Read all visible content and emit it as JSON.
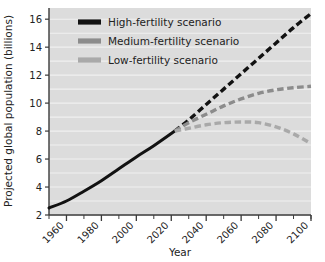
{
  "chart_data": {
    "type": "line",
    "title": "",
    "subtitle": "",
    "xlabel": "Year",
    "ylabel": "Projected global population (billions)",
    "xlim": [
      1950,
      2100
    ],
    "ylim": [
      2,
      16.8
    ],
    "grid": true,
    "grid_orientation": "horizontal",
    "legend_position": "top-center",
    "xticks": [
      1960,
      1980,
      2000,
      2020,
      2040,
      2060,
      2080,
      2100
    ],
    "xtick_labels": [
      "1960",
      "1980",
      "2000",
      "2020",
      "2040",
      "2060",
      "2080",
      "2100"
    ],
    "xminor_ticks": [
      1950,
      1970,
      1990,
      2010,
      2030,
      2050,
      2070,
      2090,
      2100
    ],
    "yticks": [
      2,
      4,
      6,
      8,
      10,
      12,
      14,
      16
    ],
    "ytick_labels": [
      "2",
      "4",
      "6",
      "8",
      "10",
      "12",
      "14",
      "16"
    ],
    "branch_point": {
      "x": 2022,
      "y": 8.0
    },
    "series": [
      {
        "name": "Historical",
        "style": "solid",
        "color": "#121212",
        "x": [
          1950,
          1960,
          1970,
          1980,
          1990,
          2000,
          2010,
          2022
        ],
        "values": [
          2.5,
          3.0,
          3.7,
          4.45,
          5.3,
          6.15,
          6.95,
          8.0
        ]
      },
      {
        "name": "High-fertility scenario",
        "style": "dashed",
        "color": "#121212",
        "x": [
          2022,
          2030,
          2040,
          2050,
          2060,
          2070,
          2080,
          2090,
          2100
        ],
        "values": [
          8.0,
          8.8,
          9.9,
          11.0,
          12.1,
          13.2,
          14.3,
          15.4,
          16.4
        ]
      },
      {
        "name": "Medium-fertility scenario",
        "style": "dashed",
        "color": "#8c8c8c",
        "x": [
          2022,
          2030,
          2040,
          2050,
          2060,
          2070,
          2080,
          2090,
          2100
        ],
        "values": [
          8.0,
          8.6,
          9.2,
          9.8,
          10.3,
          10.7,
          10.95,
          11.1,
          11.2
        ]
      },
      {
        "name": "Low-fertility scenario",
        "style": "dashed",
        "color": "#a9a9a9",
        "x": [
          2022,
          2030,
          2040,
          2050,
          2060,
          2070,
          2080,
          2090,
          2100
        ],
        "values": [
          8.0,
          8.2,
          8.45,
          8.6,
          8.65,
          8.6,
          8.3,
          7.8,
          7.1
        ]
      }
    ]
  },
  "legend": {
    "items": [
      {
        "label": "High-fertility scenario",
        "color": "#121212"
      },
      {
        "label": "Medium-fertility scenario",
        "color": "#8c8c8c"
      },
      {
        "label": "Low-fertility scenario",
        "color": "#a9a9a9"
      }
    ]
  },
  "axes": {
    "x_title": "Year",
    "y_title": "Projected global population (billions)"
  },
  "colors": {
    "plot_background": "#dcdcdc",
    "gridline": "#f0f0f0",
    "axis": "#3a3a3a",
    "high": "#121212",
    "medium": "#8c8c8c",
    "low": "#a9a9a9"
  }
}
